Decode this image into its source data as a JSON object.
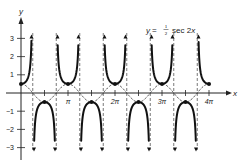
{
  "chart_data": {
    "type": "line",
    "title_parts": {
      "lhs": "y =",
      "num": "1",
      "den": "2",
      "rhs": "sec 2x"
    },
    "xlabel": "x",
    "ylabel": "y",
    "x_tick_labels": [
      "π",
      "2π",
      "3π",
      "4π"
    ],
    "x_tick_values": [
      3.14159,
      6.28319,
      9.42478,
      12.56637
    ],
    "y_tick_labels": [
      "3",
      "2",
      "1",
      "-1",
      "-2",
      "-3"
    ],
    "y_tick_values": [
      3,
      2,
      1,
      -1,
      -2,
      -3
    ],
    "xlim": [
      0,
      12.57
    ],
    "ylim": [
      -3,
      3
    ],
    "grid": false,
    "series": [
      {
        "name": "y = 1/2 sec 2x",
        "style": "solid-bold",
        "formula": "0.5/cos(2x)"
      },
      {
        "name": "y = 1/2 cos 2x",
        "style": "dashed",
        "formula": "0.5*cos(2x)"
      }
    ],
    "asymptotes": [
      "π/4",
      "3π/4",
      "5π/4",
      "7π/4",
      "9π/4",
      "11π/4",
      "13π/4",
      "15π/4"
    ],
    "marked_points": [
      {
        "x": "0",
        "y": 0.5
      },
      {
        "x": "π/2",
        "y": -0.5
      },
      {
        "x": "π",
        "y": 0.5
      },
      {
        "x": "3π/2",
        "y": -0.5
      },
      {
        "x": "2π",
        "y": 0.5
      },
      {
        "x": "5π/2",
        "y": -0.5
      },
      {
        "x": "3π",
        "y": 0.5
      },
      {
        "x": "7π/2",
        "y": -0.5
      },
      {
        "x": "4π",
        "y": 0.5
      }
    ]
  }
}
